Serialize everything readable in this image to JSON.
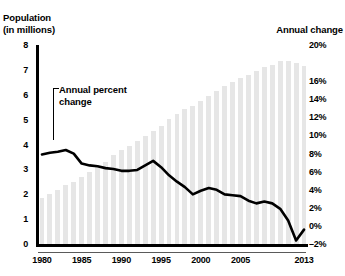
{
  "chart_data": {
    "type": "bar",
    "title": "",
    "xlabel": "",
    "left_axis": {
      "title": "Population\n(in millions)",
      "ticks": [
        "8",
        "7",
        "6",
        "5",
        "4",
        "3",
        "2",
        "1",
        "0"
      ],
      "values": [
        8,
        7,
        6,
        5,
        4,
        3,
        2,
        1,
        0
      ],
      "ylim": [
        0,
        8
      ]
    },
    "right_axis": {
      "title": "Annual change",
      "ticks": [
        "20%",
        "16%",
        "14%",
        "12%",
        "10%",
        "8%",
        "6%",
        "4%",
        "2%",
        "0%",
        "–2%"
      ],
      "values": [
        20,
        16,
        14,
        12,
        10,
        8,
        6,
        4,
        2,
        0,
        -2
      ],
      "ylim": [
        -2,
        20
      ]
    },
    "x": [
      1980,
      1981,
      1982,
      1983,
      1984,
      1985,
      1986,
      1987,
      1988,
      1989,
      1990,
      1991,
      1992,
      1993,
      1994,
      1995,
      1996,
      1997,
      1998,
      1999,
      2000,
      2001,
      2002,
      2003,
      2004,
      2005,
      2006,
      2007,
      2008,
      2009,
      2010,
      2011,
      2012,
      2013
    ],
    "xticks": [
      "1980",
      "1985",
      "1990",
      "1995",
      "2000",
      "2005",
      "2013"
    ],
    "xtick_values": [
      1980,
      1985,
      1990,
      1995,
      2000,
      2005,
      2013
    ],
    "grid": false,
    "legend": "none",
    "series": [
      {
        "name": "Population (in millions)",
        "type": "bar",
        "axis": "left",
        "color": "#e6e6e6",
        "values": [
          1.9,
          2.05,
          2.2,
          2.4,
          2.55,
          2.75,
          2.95,
          3.15,
          3.35,
          3.6,
          3.8,
          4.0,
          4.2,
          4.4,
          4.6,
          4.8,
          5.05,
          5.25,
          5.45,
          5.6,
          5.8,
          6.0,
          6.2,
          6.4,
          6.55,
          6.7,
          6.85,
          7.0,
          7.15,
          7.25,
          7.4,
          7.4,
          7.3,
          7.2
        ]
      },
      {
        "name": "Annual percent change",
        "type": "line",
        "axis": "right",
        "color": "#000000",
        "values": [
          8.0,
          8.2,
          8.3,
          8.5,
          8.1,
          7.0,
          6.8,
          6.7,
          6.5,
          6.4,
          6.2,
          6.2,
          6.3,
          6.8,
          7.3,
          6.6,
          5.7,
          5.0,
          4.4,
          3.6,
          4.0,
          4.3,
          4.1,
          3.6,
          3.5,
          3.4,
          2.9,
          2.6,
          2.8,
          2.6,
          2.0,
          0.7,
          -1.5,
          -0.3
        ]
      }
    ],
    "annotations": [
      {
        "text": "Annual percent\nchange",
        "points_to_series": "Annual percent change",
        "points_to_x": 1981
      }
    ]
  }
}
